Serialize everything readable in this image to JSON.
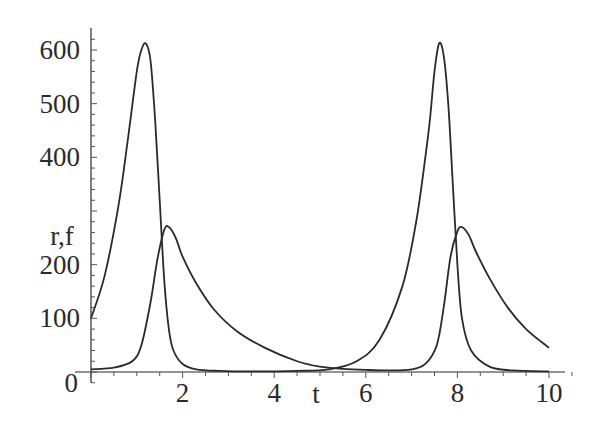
{
  "chart_data": {
    "type": "line",
    "title": "",
    "xlabel": "t",
    "ylabel": "r,f",
    "xlim": [
      0,
      10
    ],
    "ylim": [
      0,
      630
    ],
    "x_ticks": [
      2,
      4,
      6,
      8,
      10
    ],
    "y_ticks": [
      0,
      100,
      200,
      300,
      400,
      500,
      600
    ],
    "y_tick_labels": [
      "0",
      "100",
      "200",
      "",
      "400",
      "500",
      "600"
    ],
    "grid": false,
    "legend": null,
    "line_color": "#2a2a2a",
    "series": [
      {
        "name": "r",
        "x": [
          0,
          0.3,
          0.6,
          0.8,
          1.0,
          1.1,
          1.2,
          1.3,
          1.4,
          1.5,
          1.6,
          1.7,
          1.8,
          2.0,
          2.3,
          2.8,
          3.5,
          4.5,
          5.2,
          5.8,
          6.3,
          6.8,
          7.1,
          7.3,
          7.4,
          7.5,
          7.6,
          7.7,
          7.8,
          7.9,
          8.0,
          8.1,
          8.3,
          8.7,
          9.2,
          10.0
        ],
        "y": [
          100,
          180,
          310,
          430,
          560,
          600,
          612,
          580,
          470,
          320,
          170,
          80,
          40,
          15,
          5,
          2,
          1,
          2,
          5,
          20,
          60,
          160,
          280,
          400,
          470,
          560,
          612,
          590,
          500,
          350,
          200,
          100,
          40,
          10,
          3,
          1
        ]
      },
      {
        "name": "f",
        "x": [
          0,
          0.5,
          0.9,
          1.1,
          1.3,
          1.45,
          1.6,
          1.7,
          1.85,
          2.0,
          2.3,
          2.7,
          3.2,
          3.8,
          4.5,
          5.0,
          5.5,
          6.0,
          6.5,
          7.0,
          7.3,
          7.55,
          7.7,
          7.85,
          8.0,
          8.1,
          8.25,
          8.4,
          8.7,
          9.1,
          9.5,
          10.0
        ],
        "y": [
          5,
          8,
          20,
          50,
          130,
          210,
          265,
          270,
          250,
          215,
          165,
          115,
          75,
          45,
          20,
          10,
          6,
          4,
          3,
          5,
          15,
          50,
          120,
          215,
          262,
          270,
          255,
          225,
          175,
          120,
          80,
          45
        ]
      }
    ]
  }
}
